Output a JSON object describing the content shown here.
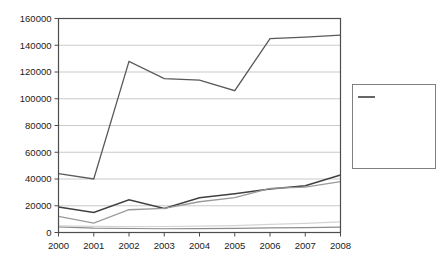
{
  "chart_data": {
    "type": "line",
    "title": "",
    "xlabel": "",
    "ylabel": "",
    "x": [
      2000,
      2001,
      2002,
      2003,
      2004,
      2005,
      2006,
      2007,
      2008
    ],
    "xtick_labels": [
      "2000",
      "2001",
      "2002",
      "2003",
      "2004",
      "2005",
      "2006",
      "2007",
      "2008"
    ],
    "ytick_labels": [
      "0",
      "20000",
      "40000",
      "60000",
      "80000",
      "100000",
      "120000",
      "140000",
      "160000"
    ],
    "ytick_values": [
      0,
      20000,
      40000,
      60000,
      80000,
      100000,
      120000,
      140000,
      160000
    ],
    "ylim": [
      0,
      160000
    ],
    "xlim": [
      2000,
      2008
    ],
    "grid": "horizontal",
    "legend_position": "right",
    "series": [
      {
        "name": "India",
        "color": "#404040",
        "width": 1.5,
        "values": [
          19000,
          15000,
          24500,
          18000,
          26000,
          29000,
          32500,
          35000,
          43000
        ]
      },
      {
        "name": "Indonesia",
        "color": "#8c8c8c",
        "width": 1.2,
        "values": [
          4200,
          3200,
          3000,
          2800,
          2900,
          3100,
          3400,
          3600,
          4000
        ]
      },
      {
        "name": "Iran",
        "color": "#d4d4d4",
        "width": 1.2,
        "values": [
          5000,
          4600,
          4400,
          4500,
          4800,
          5200,
          6000,
          6800,
          8000
        ]
      },
      {
        "name": "Malaysia",
        "color": "#9a9a9a",
        "width": 1.3,
        "values": [
          12000,
          7000,
          17000,
          18000,
          23000,
          26000,
          33000,
          34000,
          38000
        ]
      },
      {
        "name": "Turkey",
        "color": "#595959",
        "width": 1.3,
        "values": [
          44000,
          40000,
          128000,
          115000,
          114000,
          106000,
          145000,
          146000,
          147500
        ]
      }
    ]
  },
  "legend": {
    "entries": [
      "India",
      "Indonesia",
      "Iran",
      "Malaysia",
      "Turkey"
    ]
  }
}
